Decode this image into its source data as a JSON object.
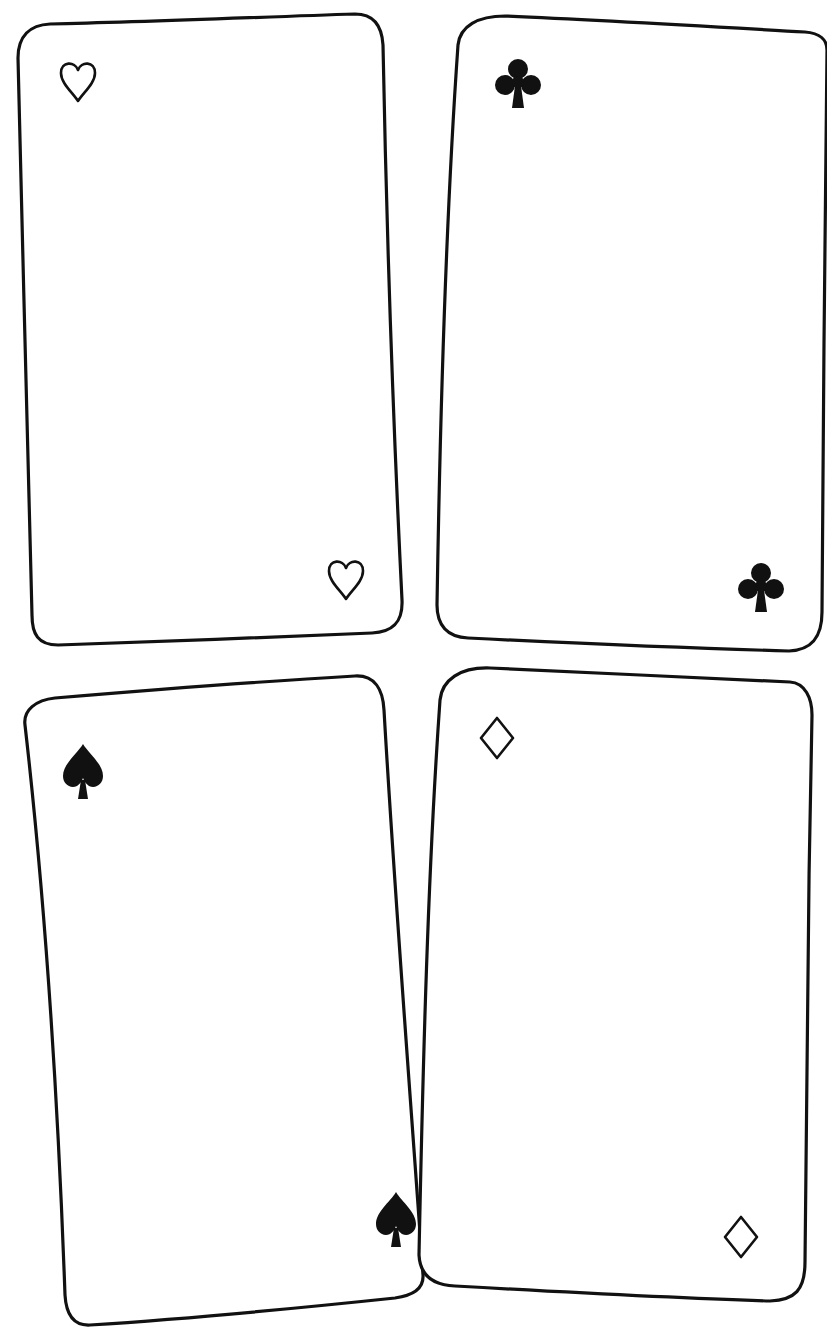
{
  "illustration": {
    "description": "Four hand-drawn blank playing cards arranged in a 2x2 grid, each showing only corner suit pips",
    "stroke_color": "#111111",
    "background_color": "#ffffff",
    "cards": [
      {
        "suit": "hearts",
        "icon": "heart-outline-icon",
        "style": "outline",
        "position": "top-left"
      },
      {
        "suit": "clubs",
        "icon": "club-solid-icon",
        "style": "solid",
        "position": "top-right"
      },
      {
        "suit": "spades",
        "icon": "spade-solid-icon",
        "style": "solid",
        "position": "bottom-left"
      },
      {
        "suit": "diamonds",
        "icon": "diamond-outline-icon",
        "style": "outline",
        "position": "bottom-right"
      }
    ]
  }
}
